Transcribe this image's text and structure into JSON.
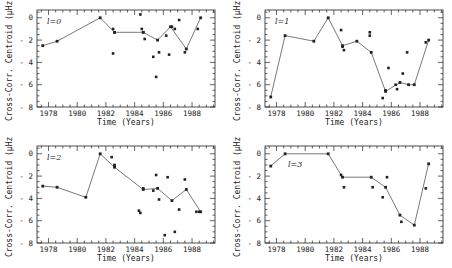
{
  "chart_data": [
    {
      "type": "line",
      "panel": "l=0",
      "label": "l=0",
      "xlabel": "Time (Years)",
      "ylabel": "Cross-Corr. Centroid (µHz)",
      "xlim": [
        1977.2,
        1989.6
      ],
      "ylim": [
        -8,
        0.7
      ],
      "xticks": [
        1978,
        1980,
        1982,
        1984,
        1986,
        1988
      ],
      "yticks": [
        0,
        -2,
        -4,
        -6,
        -8
      ],
      "line": {
        "x": [
          1977.6,
          1978.6,
          1981.6,
          1982.6,
          1984.6,
          1985.6,
          1986.5,
          1987.6,
          1988.6
        ],
        "y": [
          -2.5,
          -2.1,
          0.0,
          -1.3,
          -1.3,
          -2.0,
          -0.8,
          -2.8,
          0.0
        ]
      },
      "points": {
        "x": [
          1982.5,
          1982.6,
          1982.5,
          1984.4,
          1984.5,
          1984.6,
          1984.7,
          1985.3,
          1985.5,
          1985.7,
          1986.2,
          1986.4,
          1986.6,
          1986.8,
          1987.1,
          1987.5,
          1988.4
        ],
        "y": [
          -1.0,
          -1.3,
          -3.2,
          0.3,
          -1.0,
          -1.3,
          -1.9,
          -3.5,
          -5.3,
          -3.1,
          -1.6,
          -3.3,
          -0.8,
          -1.0,
          -0.2,
          -3.1,
          -1.0
        ]
      }
    },
    {
      "type": "line",
      "panel": "l=1",
      "label": "l=1",
      "xlabel": "Time (Years)",
      "ylabel": "Cross-Corr. Centroid (µHz)",
      "xlim": [
        1977.2,
        1989.6
      ],
      "ylim": [
        -8,
        0.7
      ],
      "xticks": [
        1978,
        1980,
        1982,
        1984,
        1986,
        1988
      ],
      "yticks": [
        0,
        -2,
        -4,
        -6,
        -8
      ],
      "line": {
        "x": [
          1977.6,
          1978.6,
          1980.6,
          1981.6,
          1982.6,
          1983.6,
          1984.6,
          1985.6,
          1986.6,
          1987.2,
          1987.6,
          1988.6
        ],
        "y": [
          -7.1,
          -1.6,
          -2.1,
          0.0,
          -2.5,
          -2.1,
          -3.1,
          -6.6,
          -5.8,
          -6.0,
          -6.0,
          -2.0
        ]
      },
      "points": {
        "x": [
          1982.5,
          1982.6,
          1982.7,
          1984.5,
          1984.5,
          1985.4,
          1985.6,
          1985.8,
          1986.3,
          1986.4,
          1986.8,
          1987.1,
          1988.4
        ],
        "y": [
          -1.1,
          -2.6,
          -2.9,
          -1.3,
          -1.6,
          -7.2,
          -6.5,
          -4.5,
          -6.0,
          -6.4,
          -5.0,
          -3.1,
          -2.2
        ]
      }
    },
    {
      "type": "line",
      "panel": "l=2",
      "label": "l=2",
      "xlabel": "Time (Years)",
      "ylabel": "Cross-Corr. Centroid (µHz)",
      "xlim": [
        1977.2,
        1989.6
      ],
      "ylim": [
        -8,
        0.7
      ],
      "xticks": [
        1978,
        1980,
        1982,
        1984,
        1986,
        1988
      ],
      "yticks": [
        0,
        -2,
        -4,
        -6,
        -8
      ],
      "line": {
        "x": [
          1977.6,
          1978.6,
          1980.6,
          1981.6,
          1982.6,
          1984.6,
          1985.6,
          1986.6,
          1987.6,
          1988.6
        ],
        "y": [
          -2.9,
          -3.0,
          -3.9,
          0.0,
          -1.2,
          -3.2,
          -3.1,
          -4.2,
          -3.2,
          -5.2
        ]
      },
      "points": {
        "x": [
          1982.4,
          1982.6,
          1982.6,
          1984.3,
          1984.4,
          1984.6,
          1985.3,
          1985.5,
          1985.7,
          1986.1,
          1986.3,
          1986.8,
          1987.1,
          1987.5,
          1988.3,
          1988.5
        ],
        "y": [
          -0.3,
          -1.0,
          -1.1,
          -5.1,
          -5.3,
          -3.1,
          -3.3,
          -1.9,
          -4.1,
          -7.3,
          -2.1,
          -7.0,
          -5.0,
          -2.3,
          -5.2,
          -5.2
        ]
      }
    },
    {
      "type": "line",
      "panel": "l=3",
      "label": "l=3",
      "xlabel": "Time (Years)",
      "ylabel": "Cross-Corr. Centroid (µHz)",
      "xlim": [
        1977.2,
        1989.6
      ],
      "ylim": [
        -8,
        0.7
      ],
      "xticks": [
        1978,
        1980,
        1982,
        1984,
        1986,
        1988
      ],
      "yticks": [
        0,
        -2,
        -4,
        -6,
        -8
      ],
      "line": {
        "x": [
          1977.6,
          1978.6,
          1981.6,
          1982.6,
          1984.6,
          1985.6,
          1986.6,
          1987.6,
          1988.6
        ],
        "y": [
          -1.1,
          0.0,
          0.0,
          -2.1,
          -2.1,
          -3.0,
          -5.5,
          -6.4,
          -0.9
        ]
      },
      "points": {
        "x": [
          1982.5,
          1982.7,
          1984.7,
          1985.4,
          1985.7,
          1986.7,
          1988.4
        ],
        "y": [
          -1.9,
          -3.0,
          -3.0,
          -3.9,
          -2.1,
          -6.1,
          -3.1
        ]
      }
    }
  ],
  "panels": [
    {
      "tag": "l=0"
    },
    {
      "tag": "l=1"
    },
    {
      "tag": "l=2"
    },
    {
      "tag": "l=3"
    }
  ],
  "axes": {
    "xlabel": "Time (Years)",
    "ylabel": "Cross-Corr. Centroid (µHz)",
    "xtick_labels": [
      "1978",
      "1980",
      "1982",
      "1984",
      "1986",
      "1988"
    ],
    "ytick_labels": [
      "0",
      "-2",
      "-4",
      "-6",
      "-8"
    ]
  },
  "colors": {
    "ink": "#222222",
    "line": "#555555",
    "background": "#ffffff"
  }
}
